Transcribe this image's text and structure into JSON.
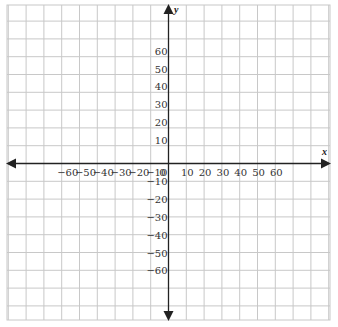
{
  "chart_data": {
    "type": "coordinate-plane",
    "title": "",
    "xlabel": "x",
    "ylabel": "y",
    "grid": true,
    "grid_step": 10,
    "xlim": [
      -90,
      90
    ],
    "ylim": [
      -90,
      90
    ],
    "x_ticks": [
      {
        "value": -60,
        "label": "−60"
      },
      {
        "value": -50,
        "label": "−50"
      },
      {
        "value": -40,
        "label": "−40"
      },
      {
        "value": -30,
        "label": "−30"
      },
      {
        "value": -20,
        "label": "−20"
      },
      {
        "value": -10,
        "label": "−10"
      },
      {
        "value": 0,
        "label": "0"
      },
      {
        "value": 10,
        "label": "10"
      },
      {
        "value": 20,
        "label": "20"
      },
      {
        "value": 30,
        "label": "30"
      },
      {
        "value": 40,
        "label": "40"
      },
      {
        "value": 50,
        "label": "50"
      },
      {
        "value": 60,
        "label": "60"
      }
    ],
    "y_ticks": [
      {
        "value": 60,
        "label": "60"
      },
      {
        "value": 50,
        "label": "50"
      },
      {
        "value": 40,
        "label": "40"
      },
      {
        "value": 30,
        "label": "30"
      },
      {
        "value": 20,
        "label": "20"
      },
      {
        "value": 10,
        "label": "10"
      },
      {
        "value": -10,
        "label": "−10"
      },
      {
        "value": -20,
        "label": "−20"
      },
      {
        "value": -30,
        "label": "−30"
      },
      {
        "value": -40,
        "label": "−40"
      },
      {
        "value": -50,
        "label": "−50"
      },
      {
        "value": -60,
        "label": "−60"
      }
    ],
    "series": []
  },
  "colors": {
    "grid": "#c8c8c8",
    "axis": "#222222",
    "label": "#333333",
    "background": "#ffffff"
  }
}
